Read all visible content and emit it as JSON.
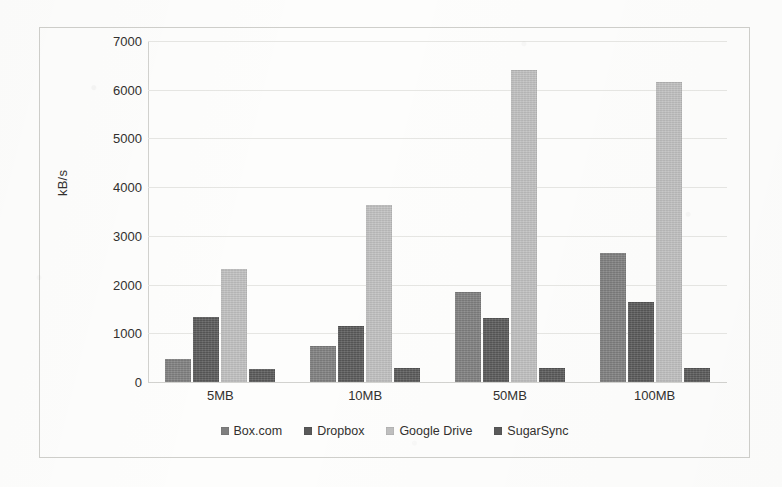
{
  "chart_data": {
    "type": "bar",
    "title": "",
    "subtitle": "",
    "xlabel": "",
    "ylabel": "kB/s",
    "categories": [
      "5MB",
      "10MB",
      "50MB",
      "100MB"
    ],
    "ylim": [
      0,
      7000
    ],
    "ytick_labels": [
      "7000",
      "6000",
      "5000",
      "4000",
      "3000",
      "2000",
      "1000",
      "0"
    ],
    "ytick_values": [
      7000,
      6000,
      5000,
      4000,
      3000,
      2000,
      1000,
      0
    ],
    "grid": true,
    "grid_axis": "y",
    "legend_position": "bottom",
    "orientation": "vertical",
    "series": [
      {
        "name": "Box.com",
        "color": "#7f7f7f",
        "values": [
          480,
          730,
          1850,
          2650
        ]
      },
      {
        "name": "Dropbox",
        "color": "#595959",
        "values": [
          1330,
          1150,
          1320,
          1640
        ]
      },
      {
        "name": "Google Drive",
        "color": "#bfbfbf",
        "values": [
          2330,
          3630,
          6400,
          6150
        ]
      },
      {
        "name": "SugarSync",
        "color": "#595959",
        "values": [
          270,
          290,
          280,
          280
        ]
      }
    ]
  },
  "legend": {
    "items": [
      {
        "label": "Box.com",
        "swatch_name": "legend-swatch-box-com"
      },
      {
        "label": "Dropbox",
        "swatch_name": "legend-swatch-dropbox"
      },
      {
        "label": "Google Drive",
        "swatch_name": "legend-swatch-google-drive"
      },
      {
        "label": "SugarSync",
        "swatch_name": "legend-swatch-sugarsync"
      }
    ]
  },
  "colors": {
    "grid": "#e6e6e3",
    "axis": "#d2d2cf",
    "frame": "#cfcfcb",
    "text": "#32302e",
    "background": "#fdfdfc"
  }
}
